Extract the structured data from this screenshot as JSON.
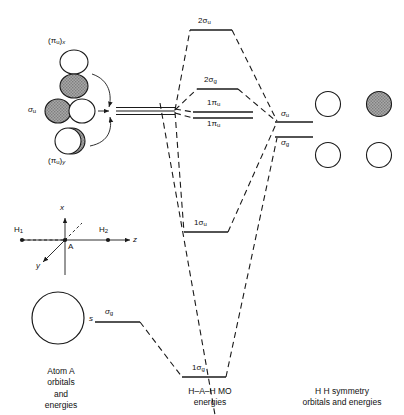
{
  "figure": {
    "type": "molecular-orbital-correlation-diagram",
    "system": "H-A-H",
    "captions": {
      "left": "Atom A\norbitals\nand\nenergies",
      "center": "H–A–H MO\nenergies",
      "right": "H    H symmetry\norbitals and energies"
    }
  },
  "left_panel": {
    "orbitals": [
      {
        "name": "pi-u-x",
        "label_main": "(π",
        "label_sub": "u",
        "label_close": ")",
        "label_axis": "x",
        "shape": "p-vertical",
        "top_lobe": "white",
        "bottom_lobe": "shaded"
      },
      {
        "name": "sigma-u-p",
        "label_main": "σ",
        "label_sub": "u",
        "shape": "p-horizontal",
        "left_lobe": "shaded",
        "right_lobe": "white"
      },
      {
        "name": "pi-u-y",
        "label_main": "(π",
        "label_sub": "u",
        "label_close": ")",
        "label_axis": "y",
        "shape": "p-into-page",
        "front_lobe": "white",
        "back_lobe": "shaded"
      },
      {
        "name": "s-orbital",
        "label_main": "s",
        "shape": "sphere",
        "fill": "white"
      }
    ],
    "s_level_label_main": "σ",
    "s_level_label_sub": "g"
  },
  "axis_inset": {
    "center_atom": "A",
    "left_atom_main": "H",
    "left_atom_sub": "1",
    "right_atom_main": "H",
    "right_atom_sub": "2",
    "axis_x": "x",
    "axis_y": "y",
    "axis_z": "z"
  },
  "center_levels": [
    {
      "name": "2-sigma-u",
      "main": "2σ",
      "sub": "u"
    },
    {
      "name": "2-sigma-g",
      "main": "2σ",
      "sub": "g"
    },
    {
      "name": "1-pi-u-upper",
      "main": "1π",
      "sub": "u"
    },
    {
      "name": "1-pi-u-lower",
      "main": "1π",
      "sub": "u"
    },
    {
      "name": "1-sigma-u",
      "main": "1σ",
      "sub": "u"
    },
    {
      "name": "1-sigma-g",
      "main": "1σ",
      "sub": "g"
    }
  ],
  "right_panel": {
    "levels": [
      {
        "name": "sigma-u",
        "main": "σ",
        "sub": "u"
      },
      {
        "name": "sigma-g",
        "main": "σ",
        "sub": "g"
      }
    ],
    "circles": [
      {
        "name": "sigma-u-left-circle",
        "fill": "white"
      },
      {
        "name": "sigma-u-right-circle",
        "fill": "shaded"
      },
      {
        "name": "sigma-g-left-circle",
        "fill": "white"
      },
      {
        "name": "sigma-g-right-circle",
        "fill": "white"
      }
    ]
  },
  "colors": {
    "line": "#1a1a1a",
    "shade": "#9a9a9a",
    "white": "#ffffff"
  }
}
